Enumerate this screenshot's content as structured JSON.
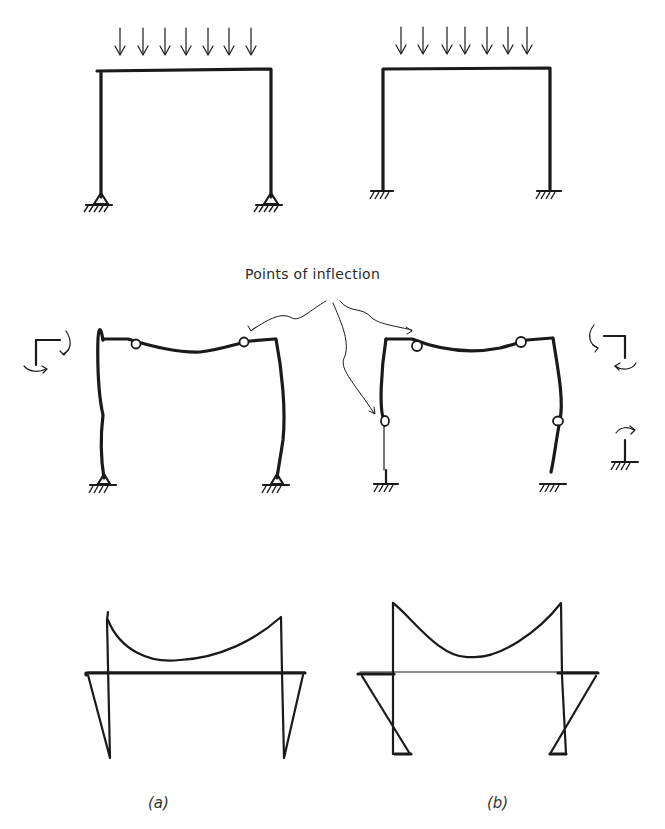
{
  "figure": {
    "annotation": "Points of inflection",
    "captions": {
      "a": "(a)",
      "b": "(b)"
    },
    "columns": [
      {
        "id": "a",
        "support_type": "pinned",
        "caption": "(a)"
      },
      {
        "id": "b",
        "support_type": "fixed",
        "caption": "(b)"
      }
    ],
    "rows": [
      {
        "id": "loaded-frame",
        "description": "Portal frame under uniform distributed load (7 arrows)"
      },
      {
        "id": "deflected-shape",
        "description": "Deflected shape with points of inflection"
      },
      {
        "id": "moment-diagram",
        "description": "Bending moment diagram"
      }
    ],
    "load_arrow_count": 7,
    "colors": {
      "ink": "#1a1a1a",
      "background": "#ffffff",
      "caption": "#333333"
    }
  }
}
